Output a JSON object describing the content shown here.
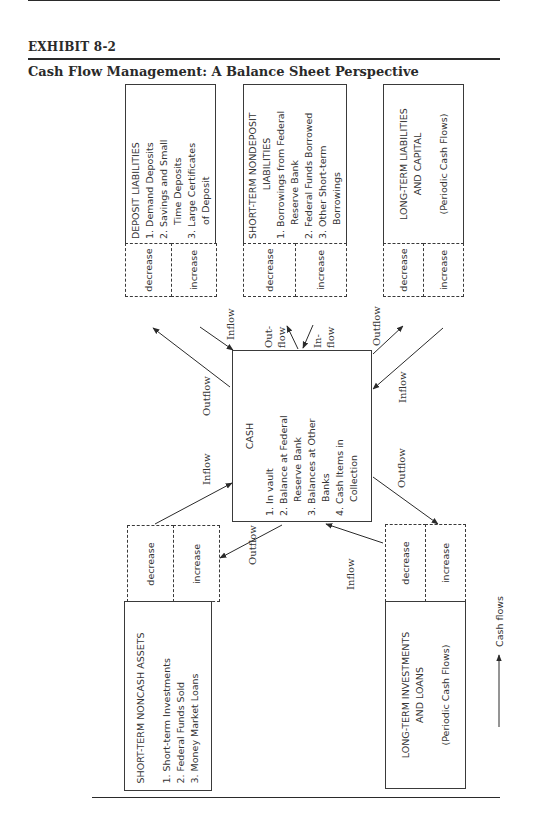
{
  "header": {
    "exhibit_label": "EXHIBIT 8-2",
    "title": "Cash Flow Management: A Balance Sheet Perspective"
  },
  "boxes": {
    "deposit_liabilities": {
      "title": "DEPOSIT LIABILITIES",
      "items": [
        "1.  Demand Deposits",
        "2.  Savings and Small",
        "Time Deposits",
        "3.  Large Certificates",
        "of Deposit"
      ],
      "decrease": "decrease",
      "increase": "increase"
    },
    "short_term_nondeposit": {
      "title_line1": "SHORT-TERM NONDEPOSIT",
      "title_line2": "LIABILITIES",
      "items": [
        "1.  Borrowings from Federal",
        "Reserve Bank",
        "2.  Federal Funds Borrowed",
        "3.  Other Short-term",
        "Borrowings"
      ],
      "decrease": "decrease",
      "increase": "increase"
    },
    "long_term_liabilities": {
      "title_line1": "LONG-TERM LIABILITIES",
      "title_line2": "AND CAPITAL",
      "note": "(Periodic Cash Flows)",
      "decrease": "decrease",
      "increase": "increase"
    },
    "cash": {
      "title": "CASH",
      "items": [
        "1.  In vault",
        "2.  Balance at Federal",
        "Reserve Bank",
        "3.  Balances at Other",
        "Banks",
        "4.  Cash Items in",
        "Collection"
      ]
    },
    "short_term_noncash_assets": {
      "title": "SHORT-TERM NONCASH ASSETS",
      "items": [
        "1.  Short-term Investments",
        "2.  Federal Funds Sold",
        "3.  Money Market Loans"
      ],
      "decrease": "decrease",
      "increase": "increase"
    },
    "long_term_investments": {
      "title_line1": "LONG-TERM INVESTMENTS",
      "title_line2": "AND LOANS",
      "note": "(Periodic Cash Flows)",
      "decrease": "decrease",
      "increase": "increase"
    }
  },
  "flow_labels": {
    "dep_inflow": "Inflow",
    "dep_outflow": "Outflow",
    "nondep_outflow_1": "Out-",
    "nondep_outflow_2": "flow",
    "nondep_inflow_1": "In-",
    "nondep_inflow_2": "flow",
    "lt_liab_outflow": "Outflow",
    "lt_liab_inflow": "Inflow",
    "st_assets_inflow": "Inflow",
    "st_assets_outflow": "Outflow",
    "lt_inv_outflow": "Outflow",
    "lt_inv_inflow": "Inflow"
  },
  "legend": {
    "label": "Cash flows"
  }
}
